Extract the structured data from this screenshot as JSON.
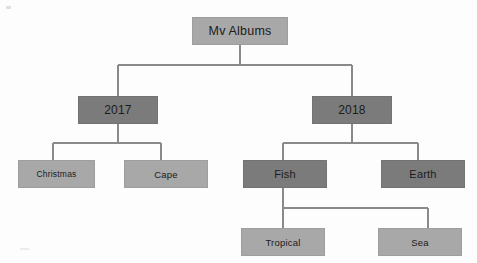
{
  "diagram": {
    "palette": {
      "background": "#fdfdfd",
      "node_light": "#a8a8a8",
      "node_dark": "#7b7b7b",
      "connector": "#8a8a8a",
      "text": "#1b1b1b"
    },
    "nodes": {
      "root": {
        "label": "Mv Albums",
        "level": 1,
        "shade": "light"
      },
      "year2017": {
        "label": "2017",
        "level": 2,
        "shade": "dark"
      },
      "year2018": {
        "label": "2018",
        "level": 2,
        "shade": "dark"
      },
      "christmas": {
        "label": "Christmas",
        "level": 3,
        "shade": "light"
      },
      "cape": {
        "label": "Cape",
        "level": 3,
        "shade": "light"
      },
      "fish": {
        "label": "Fish",
        "level": 3,
        "shade": "dark"
      },
      "earth": {
        "label": "Earth",
        "level": 3,
        "shade": "dark"
      },
      "tropical": {
        "label": "Tropical",
        "level": 4,
        "shade": "light"
      },
      "sea": {
        "label": "Sea",
        "level": 4,
        "shade": "light"
      }
    },
    "edges": [
      {
        "from": "root",
        "to": "year2017"
      },
      {
        "from": "root",
        "to": "year2018"
      },
      {
        "from": "year2017",
        "to": "christmas"
      },
      {
        "from": "year2017",
        "to": "cape"
      },
      {
        "from": "year2018",
        "to": "fish"
      },
      {
        "from": "year2018",
        "to": "earth"
      },
      {
        "from": "fish",
        "to": "tropical"
      },
      {
        "from": "fish",
        "to": "sea"
      }
    ]
  }
}
